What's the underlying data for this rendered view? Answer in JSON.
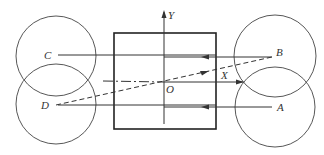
{
  "diagram": {
    "type": "geometry-schematic",
    "axes": {
      "x_label": "X",
      "y_label": "Y",
      "origin_label": "O"
    },
    "points": [
      {
        "id": "A",
        "label": "A"
      },
      {
        "id": "B",
        "label": "B"
      },
      {
        "id": "C",
        "label": "C"
      },
      {
        "id": "D",
        "label": "D"
      }
    ],
    "colors": {
      "stroke": "#333333",
      "background": "#ffffff"
    }
  }
}
